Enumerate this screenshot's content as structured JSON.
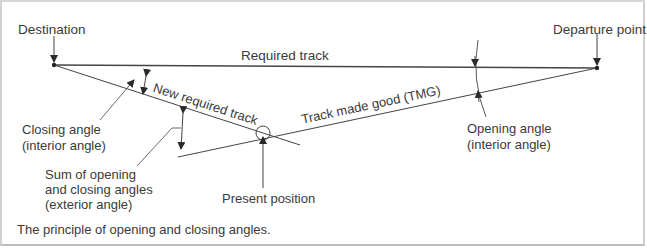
{
  "figure": {
    "caption": "The principle of opening and closing angles.",
    "colors": {
      "line": "#3a3a3a",
      "frame": "#d0d0d0",
      "background": "#ffffff"
    },
    "points": {
      "destination": {
        "label": "Destination",
        "x": 54,
        "y": 65
      },
      "departure": {
        "label": "Departure point",
        "x": 597,
        "y": 68
      },
      "present_position": {
        "label": "Present position",
        "x": 263,
        "y": 133
      }
    },
    "tracks": {
      "required_track": "Required track",
      "new_required_track": "New required track",
      "track_made_good": "Track made good (TMG)"
    },
    "angles": {
      "closing": {
        "line1": "Closing angle",
        "line2": "(interior angle)"
      },
      "opening": {
        "line1": "Opening angle",
        "line2": "(interior angle)"
      },
      "exterior": {
        "line1": "Sum of opening",
        "line2": "and closing angles",
        "line3": "(exterior angle)"
      }
    }
  }
}
